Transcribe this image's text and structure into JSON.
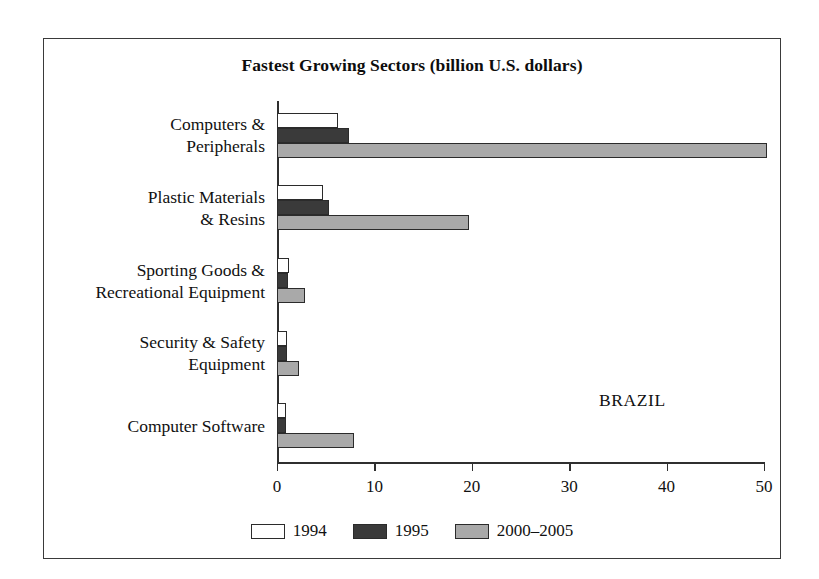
{
  "chart_data": {
    "type": "bar",
    "orientation": "horizontal",
    "title": "Fastest Growing Sectors (billion U.S. dollars)",
    "xlabel": "",
    "ylabel": "",
    "xlim": [
      0,
      50
    ],
    "xticks": [
      0,
      10,
      20,
      30,
      40,
      50
    ],
    "xtick_labels": [
      "0",
      "10",
      "20",
      "30",
      "40",
      "50"
    ],
    "grid": false,
    "legend_position": "bottom-center",
    "annotation": "BRAZIL",
    "categories": [
      "Computers &\nPeripherals",
      "Plastic Materials\n& Resins",
      "Sporting Goods &\nRecreational Equipment",
      "Security & Safety\nEquipment",
      "Computer Software"
    ],
    "series": [
      {
        "name": "1994",
        "color": "#ffffff",
        "values": [
          6.3,
          4.7,
          1.2,
          1.0,
          0.9
        ]
      },
      {
        "name": "1995",
        "color": "#3a3a3a",
        "values": [
          7.4,
          5.3,
          1.1,
          1.0,
          0.9
        ]
      },
      {
        "name": "2000-2005",
        "color": "#a9a9a9",
        "values": [
          50.3,
          19.7,
          2.9,
          2.3,
          7.9
        ]
      }
    ]
  },
  "legend": {
    "entries": [
      {
        "label": "1994"
      },
      {
        "label": "1995"
      },
      {
        "label": "2000–2005"
      }
    ]
  }
}
